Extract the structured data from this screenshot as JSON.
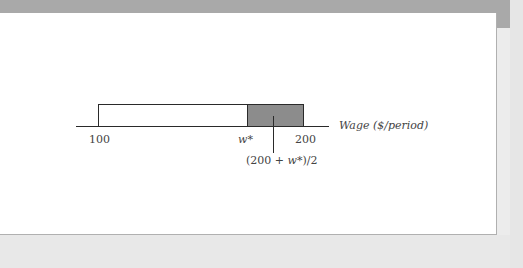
{
  "figure": {
    "axis_label": "Wage ($/period)",
    "ticks": [
      {
        "label": "100",
        "value": 100
      },
      {
        "label": "w*",
        "value": "w*"
      },
      {
        "label": "200",
        "value": 200
      }
    ],
    "midpoint_label": {
      "prefix": "(200 + ",
      "var": "w*",
      "suffix": ")/2"
    },
    "bar": {
      "range_start": 100,
      "range_end": 200,
      "shaded_from": "w*",
      "shaded_to": 200,
      "shade_color": "#8c8c8c",
      "open_color": "#ffffff"
    }
  }
}
